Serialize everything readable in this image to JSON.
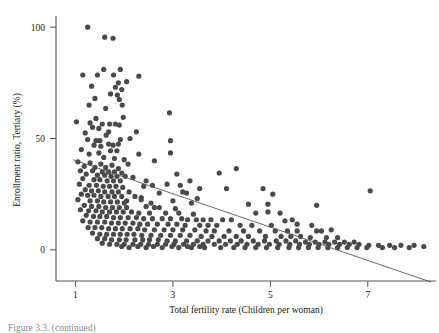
{
  "figure": {
    "caption": "Figure 3.3. (continued)"
  },
  "chart_data": {
    "type": "scatter",
    "title": "",
    "xlabel": "Total fertility rate (Children per woman)",
    "ylabel": "Enrollment ratio, Tertiary (%)",
    "xlim": [
      0.6,
      8.4
    ],
    "ylim": [
      -14,
      105
    ],
    "xticks": [
      1,
      3,
      5,
      7
    ],
    "yticks": [
      0,
      50,
      100
    ],
    "xtick_labels": [
      "1",
      "3",
      "5",
      "7"
    ],
    "ytick_labels": [
      "0",
      "50",
      "100"
    ],
    "grid": false,
    "legend": null,
    "marker": {
      "shape": "circle",
      "size_px": 5.2,
      "color": "#4a4a4a"
    },
    "trendline": {
      "type": "linear",
      "color": "#5a5a5a",
      "x_start": 0.95,
      "y_start": 40.5,
      "x_end": 8.3,
      "y_end": -14.5
    },
    "points": [
      [
        1.25,
        100.0
      ],
      [
        1.6,
        95.5
      ],
      [
        1.77,
        95.0
      ],
      [
        1.58,
        81.0
      ],
      [
        1.92,
        81.0
      ],
      [
        1.15,
        78.5
      ],
      [
        1.45,
        78.5
      ],
      [
        1.78,
        78.5
      ],
      [
        2.3,
        78.0
      ],
      [
        1.88,
        75.0
      ],
      [
        2.05,
        75.5
      ],
      [
        1.33,
        73.5
      ],
      [
        1.82,
        73.0
      ],
      [
        1.95,
        72.0
      ],
      [
        1.72,
        70.0
      ],
      [
        1.86,
        69.5
      ],
      [
        1.4,
        68.0
      ],
      [
        1.9,
        67.5
      ],
      [
        1.28,
        65.0
      ],
      [
        1.96,
        65.0
      ],
      [
        1.62,
        63.5
      ],
      [
        2.93,
        61.5
      ],
      [
        1.02,
        57.5
      ],
      [
        1.3,
        57.0
      ],
      [
        1.55,
        56.5
      ],
      [
        1.7,
        56.5
      ],
      [
        1.82,
        56.5
      ],
      [
        1.9,
        56.0
      ],
      [
        1.35,
        55.0
      ],
      [
        1.48,
        54.5
      ],
      [
        1.2,
        52.5
      ],
      [
        2.25,
        53.0
      ],
      [
        1.63,
        51.5
      ],
      [
        1.25,
        49.5
      ],
      [
        1.42,
        49.0
      ],
      [
        1.5,
        49.0
      ],
      [
        1.92,
        49.5
      ],
      [
        2.95,
        49.0
      ],
      [
        1.68,
        47.5
      ],
      [
        1.77,
        47.0
      ],
      [
        1.12,
        45.0
      ],
      [
        1.72,
        44.5
      ],
      [
        1.85,
        44.5
      ],
      [
        2.95,
        43.5
      ],
      [
        2.3,
        43.0
      ],
      [
        1.58,
        41.5
      ],
      [
        1.8,
        41.0
      ],
      [
        2.0,
        40.5
      ],
      [
        1.05,
        39.5
      ],
      [
        1.3,
        39.0
      ],
      [
        1.52,
        38.5
      ],
      [
        1.75,
        38.0
      ],
      [
        2.08,
        38.5
      ],
      [
        1.18,
        37.5
      ],
      [
        1.4,
        37.0
      ],
      [
        1.62,
        37.0
      ],
      [
        1.88,
        36.5
      ],
      [
        4.3,
        36.5
      ],
      [
        1.1,
        35.5
      ],
      [
        1.35,
        35.5
      ],
      [
        1.55,
        35.0
      ],
      [
        1.68,
        35.0
      ],
      [
        1.8,
        35.0
      ],
      [
        1.95,
        34.5
      ],
      [
        3.95,
        34.5
      ],
      [
        1.22,
        34.0
      ],
      [
        1.45,
        33.5
      ],
      [
        1.6,
        33.5
      ],
      [
        1.73,
        33.0
      ],
      [
        1.85,
        33.0
      ],
      [
        2.02,
        33.0
      ],
      [
        2.18,
        32.5
      ],
      [
        1.15,
        32.0
      ],
      [
        1.38,
        31.5
      ],
      [
        1.5,
        31.5
      ],
      [
        1.65,
        31.0
      ],
      [
        1.78,
        31.0
      ],
      [
        1.92,
        31.0
      ],
      [
        3.35,
        31.0
      ],
      [
        1.08,
        29.5
      ],
      [
        1.28,
        29.0
      ],
      [
        1.43,
        29.0
      ],
      [
        1.57,
        28.5
      ],
      [
        1.7,
        28.5
      ],
      [
        1.83,
        28.5
      ],
      [
        1.97,
        28.0
      ],
      [
        2.4,
        28.5
      ],
      [
        3.55,
        27.5
      ],
      [
        4.1,
        27.5
      ],
      [
        4.85,
        27.5
      ],
      [
        7.05,
        26.5
      ],
      [
        1.2,
        27.0
      ],
      [
        1.33,
        26.5
      ],
      [
        1.47,
        26.5
      ],
      [
        1.6,
        26.0
      ],
      [
        1.75,
        26.0
      ],
      [
        1.88,
        26.0
      ],
      [
        2.1,
        26.0
      ],
      [
        3.2,
        26.0
      ],
      [
        3.28,
        25.5
      ],
      [
        5.05,
        25.0
      ],
      [
        1.12,
        25.0
      ],
      [
        1.25,
        24.5
      ],
      [
        1.38,
        24.5
      ],
      [
        1.52,
        24.0
      ],
      [
        1.67,
        24.0
      ],
      [
        1.8,
        24.0
      ],
      [
        1.95,
        24.0
      ],
      [
        2.22,
        24.0
      ],
      [
        2.35,
        23.5
      ],
      [
        3.5,
        23.0
      ],
      [
        1.05,
        22.5
      ],
      [
        1.3,
        22.0
      ],
      [
        1.45,
        22.0
      ],
      [
        1.58,
        21.5
      ],
      [
        1.72,
        21.5
      ],
      [
        1.86,
        21.5
      ],
      [
        2.0,
        21.0
      ],
      [
        2.55,
        21.0
      ],
      [
        3.38,
        21.0
      ],
      [
        4.55,
        20.5
      ],
      [
        4.95,
        20.5
      ],
      [
        5.95,
        20.0
      ],
      [
        1.18,
        20.0
      ],
      [
        1.33,
        19.5
      ],
      [
        1.48,
        19.5
      ],
      [
        1.62,
        19.0
      ],
      [
        1.76,
        19.0
      ],
      [
        1.9,
        19.0
      ],
      [
        2.05,
        19.0
      ],
      [
        2.45,
        19.5
      ],
      [
        2.62,
        19.0
      ],
      [
        2.72,
        19.0
      ],
      [
        3.05,
        18.5
      ],
      [
        1.1,
        18.0
      ],
      [
        1.27,
        17.5
      ],
      [
        1.42,
        17.5
      ],
      [
        1.55,
        17.0
      ],
      [
        1.7,
        17.0
      ],
      [
        1.84,
        17.0
      ],
      [
        1.98,
        17.0
      ],
      [
        2.15,
        17.0
      ],
      [
        2.3,
        16.5
      ],
      [
        2.52,
        16.5
      ],
      [
        2.85,
        16.5
      ],
      [
        3.12,
        16.5
      ],
      [
        3.42,
        16.0
      ],
      [
        4.7,
        16.5
      ],
      [
        5.2,
        16.5
      ],
      [
        1.22,
        15.5
      ],
      [
        1.37,
        15.0
      ],
      [
        1.5,
        15.0
      ],
      [
        1.64,
        15.0
      ],
      [
        1.78,
        14.5
      ],
      [
        1.92,
        14.5
      ],
      [
        2.08,
        14.5
      ],
      [
        2.25,
        14.5
      ],
      [
        2.4,
        14.0
      ],
      [
        2.58,
        14.0
      ],
      [
        2.78,
        14.0
      ],
      [
        2.95,
        14.0
      ],
      [
        3.18,
        14.0
      ],
      [
        3.3,
        13.5
      ],
      [
        3.48,
        13.5
      ],
      [
        3.62,
        13.5
      ],
      [
        3.78,
        13.5
      ],
      [
        4.02,
        13.5
      ],
      [
        4.2,
        13.5
      ],
      [
        5.45,
        13.5
      ],
      [
        1.15,
        13.0
      ],
      [
        1.3,
        12.5
      ],
      [
        1.45,
        12.5
      ],
      [
        1.6,
        12.5
      ],
      [
        1.74,
        12.0
      ],
      [
        1.88,
        12.0
      ],
      [
        2.02,
        12.0
      ],
      [
        2.18,
        12.0
      ],
      [
        2.32,
        11.5
      ],
      [
        2.48,
        11.5
      ],
      [
        2.68,
        11.5
      ],
      [
        2.9,
        11.5
      ],
      [
        3.08,
        11.5
      ],
      [
        3.25,
        11.0
      ],
      [
        3.55,
        11.0
      ],
      [
        3.72,
        11.0
      ],
      [
        3.9,
        11.0
      ],
      [
        4.38,
        11.0
      ],
      [
        4.62,
        11.0
      ],
      [
        5.02,
        11.0
      ],
      [
        1.26,
        10.0
      ],
      [
        1.4,
        10.0
      ],
      [
        1.54,
        10.0
      ],
      [
        1.68,
        9.5
      ],
      [
        1.82,
        9.5
      ],
      [
        1.96,
        9.5
      ],
      [
        2.12,
        9.5
      ],
      [
        2.28,
        9.5
      ],
      [
        2.42,
        9.0
      ],
      [
        2.62,
        9.0
      ],
      [
        2.82,
        9.0
      ],
      [
        3.0,
        9.0
      ],
      [
        3.2,
        9.0
      ],
      [
        3.45,
        9.0
      ],
      [
        3.68,
        8.5
      ],
      [
        3.85,
        8.5
      ],
      [
        4.15,
        8.5
      ],
      [
        4.45,
        8.5
      ],
      [
        4.78,
        8.5
      ],
      [
        5.1,
        8.5
      ],
      [
        5.35,
        8.5
      ],
      [
        5.55,
        8.5
      ],
      [
        5.95,
        8.5
      ],
      [
        6.05,
        8.5
      ],
      [
        1.35,
        7.5
      ],
      [
        1.5,
        7.0
      ],
      [
        1.64,
        7.0
      ],
      [
        1.78,
        7.0
      ],
      [
        1.92,
        7.0
      ],
      [
        2.06,
        7.0
      ],
      [
        2.2,
        7.0
      ],
      [
        2.36,
        6.5
      ],
      [
        2.55,
        6.5
      ],
      [
        2.75,
        6.5
      ],
      [
        2.95,
        6.5
      ],
      [
        3.15,
        6.5
      ],
      [
        3.35,
        6.5
      ],
      [
        3.58,
        6.0
      ],
      [
        3.8,
        6.0
      ],
      [
        4.05,
        6.0
      ],
      [
        4.3,
        6.0
      ],
      [
        4.55,
        6.0
      ],
      [
        4.9,
        6.0
      ],
      [
        5.22,
        6.0
      ],
      [
        5.42,
        6.0
      ],
      [
        5.62,
        6.0
      ],
      [
        5.82,
        5.5
      ],
      [
        6.15,
        5.5
      ],
      [
        6.38,
        5.5
      ],
      [
        1.45,
        5.0
      ],
      [
        1.6,
        5.0
      ],
      [
        1.74,
        4.5
      ],
      [
        1.9,
        4.5
      ],
      [
        2.04,
        4.5
      ],
      [
        2.22,
        4.5
      ],
      [
        2.38,
        4.5
      ],
      [
        2.52,
        4.5
      ],
      [
        2.7,
        4.5
      ],
      [
        2.88,
        4.0
      ],
      [
        3.05,
        4.0
      ],
      [
        3.28,
        4.0
      ],
      [
        3.5,
        4.0
      ],
      [
        3.72,
        4.0
      ],
      [
        3.95,
        4.0
      ],
      [
        4.18,
        4.0
      ],
      [
        4.4,
        4.0
      ],
      [
        4.65,
        4.0
      ],
      [
        4.88,
        4.0
      ],
      [
        5.12,
        4.0
      ],
      [
        5.32,
        4.0
      ],
      [
        5.52,
        4.0
      ],
      [
        5.72,
        3.5
      ],
      [
        5.92,
        3.5
      ],
      [
        6.12,
        3.5
      ],
      [
        6.32,
        3.5
      ],
      [
        6.52,
        3.5
      ],
      [
        6.72,
        3.5
      ],
      [
        1.55,
        3.0
      ],
      [
        1.7,
        2.5
      ],
      [
        1.85,
        2.5
      ],
      [
        2.0,
        2.5
      ],
      [
        2.18,
        2.5
      ],
      [
        2.34,
        2.5
      ],
      [
        2.5,
        2.5
      ],
      [
        2.68,
        2.5
      ],
      [
        2.85,
        2.5
      ],
      [
        3.02,
        2.5
      ],
      [
        3.22,
        2.5
      ],
      [
        3.42,
        2.5
      ],
      [
        3.62,
        2.5
      ],
      [
        3.85,
        2.5
      ],
      [
        4.08,
        2.5
      ],
      [
        4.32,
        2.5
      ],
      [
        4.52,
        2.5
      ],
      [
        4.75,
        2.5
      ],
      [
        4.98,
        2.5
      ],
      [
        5.18,
        2.5
      ],
      [
        5.4,
        2.5
      ],
      [
        5.6,
        2.5
      ],
      [
        5.8,
        2.5
      ],
      [
        6.0,
        2.5
      ],
      [
        6.2,
        2.5
      ],
      [
        6.42,
        2.5
      ],
      [
        6.62,
        2.5
      ],
      [
        6.82,
        2.5
      ],
      [
        7.02,
        2.0
      ],
      [
        7.22,
        2.0
      ],
      [
        7.45,
        2.0
      ],
      [
        7.68,
        2.0
      ],
      [
        7.95,
        2.0
      ],
      [
        8.15,
        1.5
      ],
      [
        2.1,
        1.0
      ],
      [
        2.45,
        1.0
      ],
      [
        2.78,
        1.0
      ],
      [
        3.12,
        1.0
      ],
      [
        3.38,
        1.0
      ],
      [
        3.65,
        1.0
      ],
      [
        3.98,
        1.0
      ],
      [
        4.25,
        1.0
      ],
      [
        4.48,
        1.0
      ],
      [
        4.7,
        1.0
      ],
      [
        4.92,
        1.0
      ],
      [
        5.15,
        1.0
      ],
      [
        5.38,
        1.0
      ],
      [
        5.58,
        1.0
      ],
      [
        5.78,
        1.0
      ],
      [
        5.98,
        1.0
      ],
      [
        6.18,
        1.0
      ],
      [
        6.38,
        1.0
      ],
      [
        6.58,
        1.0
      ],
      [
        6.78,
        1.0
      ],
      [
        6.98,
        1.0
      ],
      [
        7.3,
        1.0
      ],
      [
        7.55,
        1.0
      ],
      [
        7.85,
        1.0
      ],
      [
        1.95,
        1.5
      ],
      [
        2.28,
        1.5
      ],
      [
        2.6,
        1.5
      ],
      [
        2.98,
        1.5
      ],
      [
        3.3,
        1.5
      ],
      [
        3.55,
        1.5
      ],
      [
        1.28,
        43.0
      ],
      [
        1.48,
        43.5
      ],
      [
        1.88,
        47.5
      ],
      [
        2.62,
        40.0
      ],
      [
        2.45,
        31.0
      ],
      [
        2.58,
        29.0
      ],
      [
        2.05,
        22.0
      ],
      [
        2.35,
        22.5
      ],
      [
        2.72,
        25.5
      ],
      [
        3.0,
        22.0
      ],
      [
        3.15,
        29.0
      ],
      [
        5.55,
        11.5
      ],
      [
        5.85,
        11.0
      ],
      [
        6.25,
        9.0
      ],
      [
        4.95,
        17.0
      ],
      [
        5.3,
        13.0
      ],
      [
        2.88,
        29.5
      ],
      [
        3.08,
        34.0
      ],
      [
        1.42,
        59.0
      ],
      [
        1.98,
        59.5
      ],
      [
        2.12,
        50.0
      ],
      [
        1.68,
        53.0
      ],
      [
        1.52,
        46.5
      ],
      [
        1.38,
        47.0
      ]
    ]
  }
}
